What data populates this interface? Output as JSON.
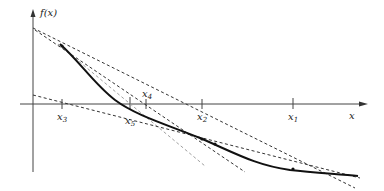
{
  "diagram": {
    "y_axis_label": "f(x)",
    "x_axis_label": "x",
    "points": [
      {
        "name": "x3",
        "base": "x",
        "sub": "3",
        "x": 62,
        "label_y": 120
      },
      {
        "name": "x5",
        "base": "x",
        "sub": "5",
        "x": 130,
        "label_y": 124
      },
      {
        "name": "x4",
        "base": "x",
        "sub": "4",
        "x": 146,
        "label_y": 97
      },
      {
        "name": "x2",
        "base": "x",
        "sub": "2",
        "x": 202,
        "label_y": 120
      },
      {
        "name": "x1",
        "base": "x",
        "sub": "1",
        "x": 293,
        "label_y": 120
      }
    ],
    "colors": {
      "curve": "#111111",
      "axes": "#444444",
      "tangent": "#333333",
      "tangent_light": "#a0a0a0"
    }
  }
}
